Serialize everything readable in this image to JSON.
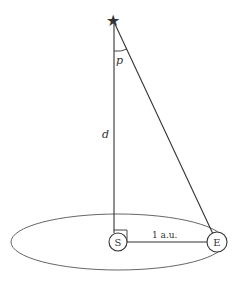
{
  "diagram": {
    "labels": {
      "star": "★",
      "parallax_angle": "p",
      "distance": "d",
      "sun": "S",
      "earth": "E",
      "baseline": "1 a.u."
    },
    "colors": {
      "line": "#333333",
      "orbit": "#555555",
      "background": "#ffffff"
    }
  }
}
